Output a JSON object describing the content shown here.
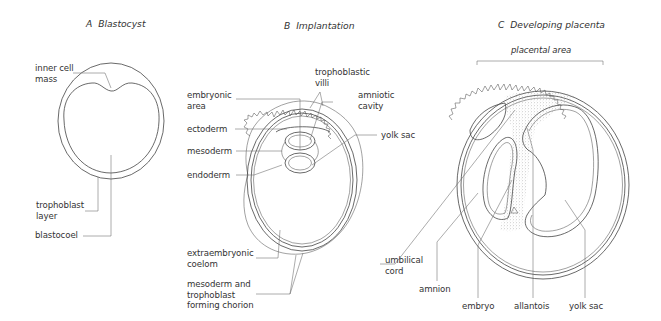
{
  "panels": {
    "a": {
      "title": "A  Blastocyst",
      "labels": {
        "inner_cell_mass": "inner cell\nmass",
        "trophoblast_layer": "trophoblast\nlayer",
        "blastocoel": "blastocoel"
      }
    },
    "b": {
      "title": "B  Implantation",
      "labels": {
        "embryonic_area": "embryonic\narea",
        "trophoblastic_villi": "trophoblastic\nvilli",
        "amniotic_cavity": "amniotic\ncavity",
        "ectoderm": "ectoderm",
        "yolk_sac": "yolk sac",
        "mesoderm": "mesoderm",
        "endoderm": "endoderm",
        "extraembryonic_coelom": "extraembryonic\ncoelom",
        "chorion": "mesoderm and\ntrophoblast\nforming chorion"
      }
    },
    "c": {
      "title": "C  Developing placenta",
      "labels": {
        "placental_area": "placental area",
        "umbilical_cord": "umbilical\ncord",
        "amnion": "amnion",
        "embryo": "embryo",
        "allantois": "allantois",
        "yolk_sac": "yolk sac"
      }
    }
  },
  "colors": {
    "stroke": "#444444",
    "stipple": "#bdbdbd",
    "background": "#ffffff"
  }
}
